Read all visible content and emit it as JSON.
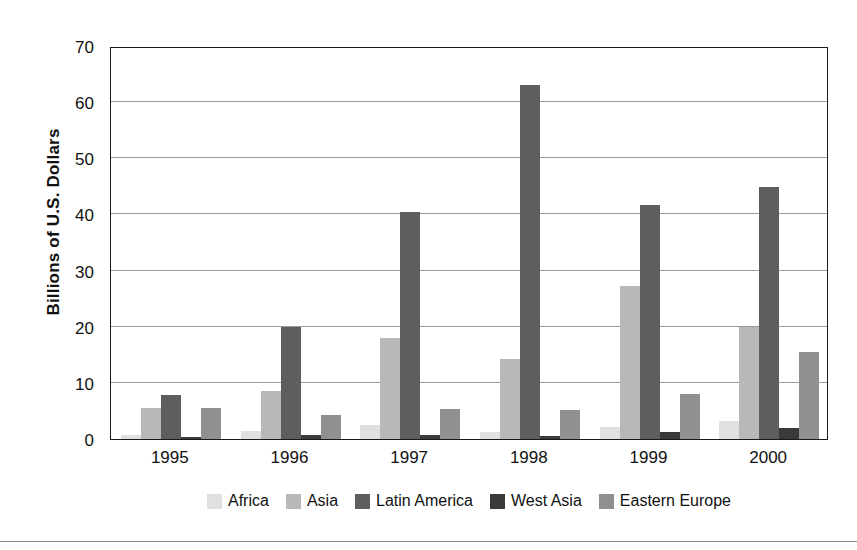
{
  "chart_data": {
    "type": "bar",
    "title": "",
    "subtitle": "",
    "xlabel": "",
    "ylabel": "Billions of U.S. Dollars",
    "categories": [
      "1995",
      "1996",
      "1997",
      "1998",
      "1999",
      "2000"
    ],
    "ylim": [
      0,
      70
    ],
    "yticks": [
      0,
      10,
      20,
      30,
      40,
      50,
      60,
      70
    ],
    "ytick_labels": [
      "0",
      "10",
      "20",
      "30",
      "40",
      "50",
      "60",
      "70"
    ],
    "grid": true,
    "grid_axis": "y",
    "legend_position": "bottom",
    "series": [
      {
        "name": "Africa",
        "color": "#e0e0e0",
        "values": [
          0.8,
          1.4,
          2.5,
          1.2,
          2.1,
          3.2
        ]
      },
      {
        "name": "Asia",
        "color": "#b8b8b8",
        "values": [
          5.5,
          8.6,
          18.0,
          14.2,
          27.2,
          20.0
        ]
      },
      {
        "name": "Latin America",
        "color": "#5e5e5e",
        "values": [
          7.8,
          20.0,
          40.5,
          63.0,
          41.6,
          44.8
        ]
      },
      {
        "name": "West Asia",
        "color": "#3a3a3a",
        "values": [
          0.3,
          0.8,
          0.8,
          0.5,
          1.2,
          1.9
        ]
      },
      {
        "name": "Eastern Europe",
        "color": "#909090",
        "values": [
          5.6,
          4.2,
          5.3,
          5.2,
          8.1,
          15.5
        ]
      }
    ]
  },
  "legend": {
    "items": [
      {
        "label": "Africa",
        "color": "#e0e0e0"
      },
      {
        "label": "Asia",
        "color": "#b8b8b8"
      },
      {
        "label": "Latin America",
        "color": "#5e5e5e"
      },
      {
        "label": "West Asia",
        "color": "#3a3a3a"
      },
      {
        "label": "Eastern Europe",
        "color": "#909090"
      }
    ]
  },
  "axes": {
    "y_title": "Billions of U.S. Dollars"
  },
  "style": {
    "frame_color": "#1a1a1a",
    "grid_color": "#9a9a9a",
    "background": "#ffffff",
    "rule_color": "#8d8d8d"
  }
}
